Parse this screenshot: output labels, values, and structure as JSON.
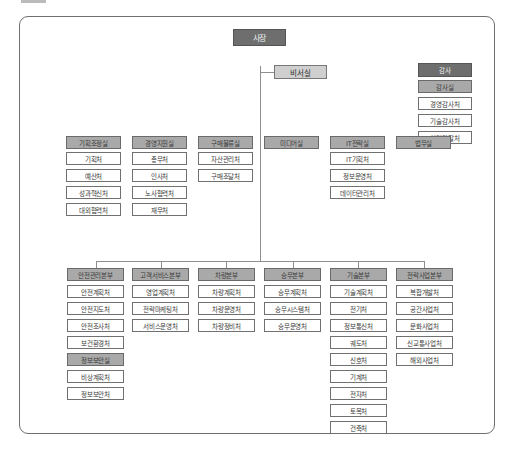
{
  "top": {
    "ceo": "사장",
    "secretary": "비서실"
  },
  "audit": {
    "header": "감사",
    "office": "감사실",
    "units": [
      "경영감사처",
      "기술감사처",
      "청렴감찰처"
    ]
  },
  "legal": "법무실",
  "staff_offices": [
    {
      "name": "기획조정실",
      "units": [
        "기획처",
        "예산처",
        "성과혁신처",
        "대외협력처"
      ]
    },
    {
      "name": "경영지원실",
      "units": [
        "총무처",
        "인사처",
        "노사협력처",
        "재무처"
      ]
    },
    {
      "name": "구매물류실",
      "units": [
        "자산관리처",
        "구매조달처"
      ]
    },
    {
      "name": "미디어실",
      "units": []
    },
    {
      "name": "IT전략실",
      "units": [
        "IT기획처",
        "정보운영처",
        "데이터관리처"
      ]
    }
  ],
  "headquarters": [
    {
      "name": "안전관리본부",
      "units": [
        "안전계획처",
        "안전지도처",
        "안전조사처",
        "보건환경처"
      ],
      "sub_office": {
        "name": "정보보안실",
        "units": [
          "비상계획처",
          "정보보안처"
        ]
      }
    },
    {
      "name": "고객서비스본부",
      "units": [
        "영업계획처",
        "전략마케팅처",
        "서비스운영처"
      ]
    },
    {
      "name": "차량본부",
      "units": [
        "차량계획처",
        "차량운영처",
        "차량정비처"
      ]
    },
    {
      "name": "승무본부",
      "units": [
        "승무계획처",
        "승무시스템처",
        "승무운영처"
      ]
    },
    {
      "name": "기술본부",
      "units": [
        "기술계획처",
        "전기처",
        "정보통신처",
        "궤도처",
        "신호처",
        "기계처",
        "전자처",
        "토목처",
        "건축처"
      ]
    },
    {
      "name": "전략사업본부",
      "units": [
        "복합개발처",
        "공간사업처",
        "문화사업처",
        "신교통사업처",
        "해외사업처"
      ]
    }
  ]
}
